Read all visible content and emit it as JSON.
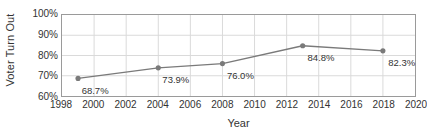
{
  "chart_data": {
    "type": "line",
    "title": "",
    "xlabel": "Year",
    "ylabel": "Voter Turn Out",
    "x": [
      1999,
      2004,
      2008,
      2013,
      2018
    ],
    "values": [
      68.7,
      73.9,
      76.0,
      84.8,
      82.3
    ],
    "point_labels": [
      "68.7%",
      "73.9%",
      "76.0%",
      "84.8%",
      "82.3%"
    ],
    "xlim": [
      1998,
      2020
    ],
    "ylim": [
      60,
      100
    ],
    "x_ticks": [
      1998,
      2000,
      2002,
      2004,
      2006,
      2008,
      2010,
      2012,
      2014,
      2016,
      2018,
      2020
    ],
    "x_tick_labels": [
      "1998",
      "2000",
      "2002",
      "2004",
      "2006",
      "2008",
      "2010",
      "2012",
      "2014",
      "2016",
      "2018",
      "2020"
    ],
    "y_ticks": [
      60,
      70,
      80,
      90,
      100
    ],
    "y_tick_labels": [
      "60%",
      "70%",
      "80%",
      "90%",
      "100%"
    ],
    "grid": true,
    "legend": "none",
    "series_color": "#7a7a7a",
    "grid_color": "#d9d9d9",
    "axis_color": "#9a9a9a",
    "text_color": "#333333"
  }
}
